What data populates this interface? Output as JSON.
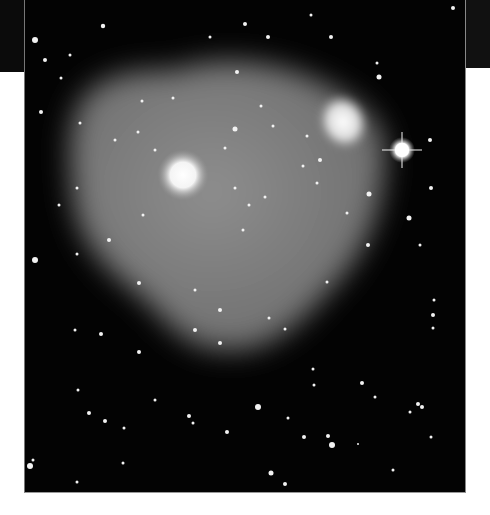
{
  "image": {
    "subject": "deep-sky astronomical photograph: diffuse grey glow (nebula/halo) over a star field",
    "background_color": "#030303",
    "glow_color": "#8a8a8a",
    "frame": {
      "x": 24,
      "y": 0,
      "width": 442,
      "height": 493
    },
    "features": {
      "bright_core": {
        "x": 158,
        "y": 175,
        "r": 16
      },
      "spiral_nebula": {
        "x": 318,
        "y": 122,
        "rx": 26,
        "ry": 30
      },
      "bright_star": {
        "x": 377,
        "y": 150,
        "r": 13
      }
    },
    "stars": [
      [
        10,
        40,
        3
      ],
      [
        78,
        26,
        2.2
      ],
      [
        185,
        37,
        1.5
      ],
      [
        220,
        24,
        2
      ],
      [
        243,
        37,
        2
      ],
      [
        286,
        15,
        1.5
      ],
      [
        306,
        37,
        2
      ],
      [
        352,
        63,
        1.5
      ],
      [
        354,
        77,
        2.5
      ],
      [
        428,
        8,
        2
      ],
      [
        20,
        60,
        2
      ],
      [
        45,
        55,
        1.5
      ],
      [
        36,
        78,
        1.5
      ],
      [
        148,
        98,
        1.5
      ],
      [
        212,
        72,
        2
      ],
      [
        236,
        106,
        1.5
      ],
      [
        16,
        112,
        2
      ],
      [
        55,
        123,
        1.5
      ],
      [
        117,
        101,
        1.5
      ],
      [
        248,
        126,
        1.5
      ],
      [
        282,
        136,
        1.5
      ],
      [
        90,
        140,
        1.5
      ],
      [
        113,
        132,
        1.5
      ],
      [
        130,
        150,
        1.5
      ],
      [
        210,
        129,
        2.5
      ],
      [
        200,
        148,
        1.5
      ],
      [
        278,
        166,
        1.5
      ],
      [
        295,
        160,
        2
      ],
      [
        405,
        140,
        2
      ],
      [
        406,
        188,
        2
      ],
      [
        344,
        194,
        2.5
      ],
      [
        10,
        260,
        3
      ],
      [
        52,
        188,
        1.5
      ],
      [
        34,
        205,
        1.5
      ],
      [
        118,
        215,
        1.5
      ],
      [
        210,
        188,
        1.5
      ],
      [
        224,
        205,
        1.5
      ],
      [
        218,
        230,
        1.5
      ],
      [
        240,
        197,
        1.5
      ],
      [
        292,
        183,
        1.5
      ],
      [
        322,
        213,
        1.5
      ],
      [
        84,
        240,
        2
      ],
      [
        52,
        254,
        1.5
      ],
      [
        114,
        283,
        2
      ],
      [
        170,
        290,
        1.5
      ],
      [
        195,
        310,
        2
      ],
      [
        302,
        282,
        1.5
      ],
      [
        343,
        245,
        2
      ],
      [
        384,
        218,
        2.5
      ],
      [
        395,
        245,
        1.5
      ],
      [
        409,
        300,
        1.5
      ],
      [
        408,
        315,
        2
      ],
      [
        408,
        328,
        1.5
      ],
      [
        50,
        330,
        1.5
      ],
      [
        76,
        334,
        2
      ],
      [
        114,
        352,
        2
      ],
      [
        170,
        330,
        2
      ],
      [
        195,
        343,
        2
      ],
      [
        244,
        318,
        1.5
      ],
      [
        260,
        329,
        1.5
      ],
      [
        288,
        369,
        1.5
      ],
      [
        289,
        385,
        1.5
      ],
      [
        337,
        383,
        2
      ],
      [
        350,
        397,
        1.5
      ],
      [
        53,
        390,
        1.5
      ],
      [
        64,
        413,
        2
      ],
      [
        80,
        421,
        2
      ],
      [
        99,
        428,
        1.5
      ],
      [
        130,
        400,
        1.5
      ],
      [
        164,
        416,
        2
      ],
      [
        168,
        423,
        1.5
      ],
      [
        202,
        432,
        2
      ],
      [
        233,
        407,
        3
      ],
      [
        263,
        418,
        1.5
      ],
      [
        279,
        437,
        2
      ],
      [
        303,
        436,
        2
      ],
      [
        307,
        445,
        3
      ],
      [
        393,
        404,
        2
      ],
      [
        397,
        407,
        2
      ],
      [
        385,
        412,
        1.5
      ],
      [
        406,
        437,
        1.5
      ],
      [
        8,
        460,
        1.5
      ],
      [
        5,
        466,
        3
      ],
      [
        52,
        482,
        1.5
      ],
      [
        98,
        463,
        1.5
      ],
      [
        246,
        473,
        2.5
      ],
      [
        260,
        484,
        2
      ],
      [
        333,
        444,
        1
      ],
      [
        368,
        470,
        1.5
      ]
    ]
  }
}
